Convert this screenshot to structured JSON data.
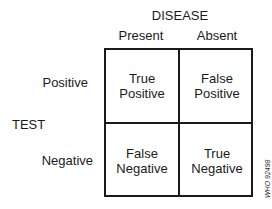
{
  "diagram": {
    "column_axis_title": "DISEASE",
    "row_axis_title": "TEST",
    "columns": [
      "Present",
      "Absent"
    ],
    "rows": [
      "Positive",
      "Negative"
    ],
    "cells": [
      [
        {
          "line1": "True",
          "line2": "Positive"
        },
        {
          "line1": "False",
          "line2": "Positive"
        }
      ],
      [
        {
          "line1": "False",
          "line2": "Negative"
        },
        {
          "line1": "True",
          "line2": "Negative"
        }
      ]
    ],
    "figure_code": "WHO 92498"
  }
}
